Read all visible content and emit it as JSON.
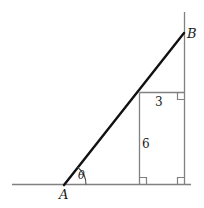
{
  "figure": {
    "type": "geometry-diagram",
    "background_color": "#ffffff",
    "line_color_main": "#111111",
    "line_color_thin": "#808080",
    "text_color": "#1a1a1a",
    "labels": {
      "vertex_a": "A",
      "vertex_b": "B",
      "angle": "θ",
      "segment_upper": "3",
      "segment_lower": "6"
    },
    "geometry": {
      "baseline": {
        "x1": 12,
        "y1": 184.5,
        "x2": 191,
        "y2": 184.5
      },
      "hypotenuse": {
        "x1": 64,
        "y1": 185,
        "x2": 184,
        "y2": 33
      },
      "right_vertical": {
        "x": 184.5,
        "y_top": 12,
        "y_bottom": 184.5
      },
      "inner_vertical": {
        "x": 139.5,
        "y_top": 92.5,
        "y_bottom": 184.5
      },
      "inner_horizontal": {
        "y": 92.5,
        "x_left": 139.5,
        "x_right": 184.5
      },
      "angle_arc": {
        "cx": 64,
        "cy": 184.5,
        "radius": 22,
        "start_deg": 0,
        "end_deg": 51.7
      },
      "right_angle_marks": [
        {
          "x": 139.5,
          "y": 184.5,
          "dx": 1,
          "dy": -1
        },
        {
          "x": 184.5,
          "y": 184.5,
          "dx": -1,
          "dy": -1
        },
        {
          "x": 184.5,
          "y": 92.5,
          "dx": -1,
          "dy": 1
        }
      ],
      "right_angle_size": 7
    }
  }
}
